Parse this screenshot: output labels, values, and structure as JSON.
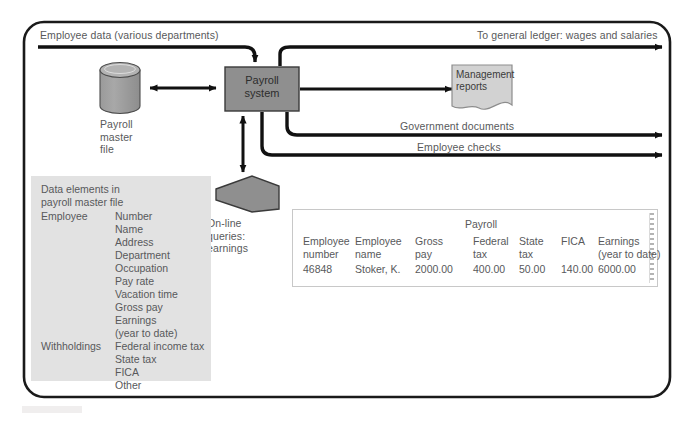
{
  "diagram": {
    "border_color": "#1a1a1a",
    "accent_fill": "#8c8c8c",
    "panel_fill": "#e2e2e2",
    "text_color": "#58595b"
  },
  "flows": {
    "input_label": "Employee data (various departments)",
    "general_ledger_label": "To general ledger: wages and salaries",
    "government_documents_label": "Government documents",
    "employee_checks_label": "Employee checks"
  },
  "nodes": {
    "payroll_system": "Payroll\nsystem",
    "master_file": "Payroll\nmaster\nfile",
    "online_queries": "On-line\nqueries:\nearnings",
    "management_reports": "Management\nreports"
  },
  "data_panel": {
    "title": "Data elements in\npayroll master file",
    "groups": [
      {
        "label": "Employee",
        "items": "Number\nName\nAddress\nDepartment\nOccupation\nPay rate\nVacation time\nGross pay\nEarnings\n(year to date)"
      },
      {
        "label": "Withholdings",
        "items": "Federal income tax\nState tax\nFICA\nOther"
      }
    ]
  },
  "payroll_table": {
    "group_title": "Payroll",
    "headers": [
      "Employee\nnumber",
      "Employee\nname",
      "Gross\npay",
      "Federal\ntax",
      "State\ntax",
      "FICA",
      "Earnings\n(year to date)"
    ],
    "row": [
      "46848",
      "Stoker, K.",
      "2000.00",
      "400.00",
      "50.00",
      "140.00",
      "6000.00"
    ]
  }
}
